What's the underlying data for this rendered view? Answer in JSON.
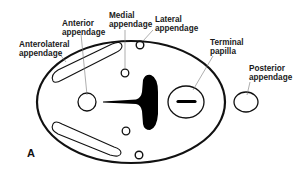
{
  "figure": {
    "panel_label": "A",
    "labels": {
      "anterolateral": [
        "Anterolateral",
        "appendage"
      ],
      "anterior": [
        "Anterior",
        "appendage"
      ],
      "medial": [
        "Medial",
        "appendage"
      ],
      "lateral": [
        "Lateral",
        "appendage"
      ],
      "terminal": [
        "Terminal",
        "papilla"
      ],
      "posterior": [
        "Posterior",
        "appendage"
      ]
    },
    "colors": {
      "stroke": "#111111",
      "fill": "#000000",
      "background": "#ffffff",
      "leader": "#777777"
    }
  }
}
